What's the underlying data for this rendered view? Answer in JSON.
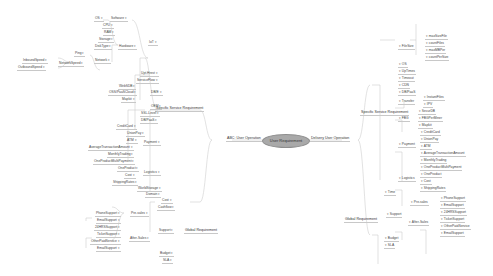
{
  "root": {
    "label": "User Requirement"
  },
  "left": {
    "label": "ABC: User Operation",
    "branches": [
      {
        "label": "Specific Service Requirement",
        "children": [
          {
            "label": "IoT",
            "children": [
              {
                "label": "Software",
                "children": [
                  {
                    "label": "OS"
                  }
                ]
              },
              {
                "label": "Hardware",
                "children": [
                  {
                    "label": "CPU"
                  },
                  {
                    "label": "RAM"
                  },
                  {
                    "label": "Storage"
                  },
                  {
                    "label": "DiskType"
                  }
                ]
              },
              {
                "label": "Network",
                "children": [
                  {
                    "label": "Ping"
                  },
                  {
                    "label": "NetworkSpeed",
                    "children": [
                      {
                        "label": "InboundSpeed"
                      },
                      {
                        "label": "OutboundSpeed"
                      }
                    ]
                  }
                ]
              }
            ]
          },
          {
            "label": "Upt.Hrest"
          },
          {
            "label": "ServiceFlow"
          },
          {
            "label": "DB/E",
            "children": [
              {
                "label": "WebSDB"
              },
              {
                "label": "OSS/PaaSCloud"
              },
              {
                "label": "Mapkit"
              }
            ]
          },
          {
            "label": "OEM"
          },
          {
            "label": "SSL-Level"
          },
          {
            "label": "DB/PaaS"
          },
          {
            "label": "Payment",
            "children": [
              {
                "label": "CreditCard"
              },
              {
                "label": "UnionPay"
              },
              {
                "label": "ATM"
              },
              {
                "label": "AverageTransactionAmount"
              },
              {
                "label": "MonthlyTrading"
              },
              {
                "label": "OneProductMultiPayment"
              }
            ]
          },
          {
            "label": "Logistics",
            "children": [
              {
                "label": "OneProduct"
              },
              {
                "label": "Cost"
              },
              {
                "label": "ShippingRates"
              }
            ]
          },
          {
            "label": "WorldStorage"
          },
          {
            "label": "Domain"
          }
        ]
      },
      {
        "label": "Global Requirement",
        "children": [
          {
            "label": "Cost"
          },
          {
            "label": "Cashflow"
          },
          {
            "label": "Support",
            "children": [
              {
                "label": "Pre-sales",
                "children": [
                  {
                    "label": "PhoneSupport"
                  },
                  {
                    "label": "EmailSupport"
                  }
                ]
              },
              {
                "label": "After-Sales",
                "children": [
                  {
                    "label": "24HRSSupport"
                  },
                  {
                    "label": "TicketSupport"
                  },
                  {
                    "label": "OtherPaidService"
                  },
                  {
                    "label": "EmailSupport"
                  }
                ]
              }
            ]
          },
          {
            "label": "Budget"
          },
          {
            "label": "SLA"
          }
        ]
      }
    ]
  },
  "right": {
    "label": "Delivery User Operation",
    "branches": [
      {
        "label": "Specific Service Requirement",
        "children": [
          {
            "label": "FileSize",
            "children": [
              {
                "label": "maxSizeFile"
              },
              {
                "label": "countFiles"
              },
              {
                "label": "maxMBPer"
              },
              {
                "label": "countPerSize"
              }
            ]
          },
          {
            "label": "OS"
          },
          {
            "label": "UpTimes"
          },
          {
            "label": "Timeout"
          },
          {
            "label": "CDN"
          },
          {
            "label": "DB/PaaS"
          },
          {
            "label": "Transfer",
            "children": [
              {
                "label": "InstantFiles"
              },
              {
                "label": "IPV"
              }
            ]
          },
          {
            "label": "FBG",
            "children": [
              {
                "label": "SecurDB"
              },
              {
                "label": "FBGPerMiner"
              },
              {
                "label": "Mapkit"
              }
            ]
          },
          {
            "label": "Payment",
            "children": [
              {
                "label": "CreditCard"
              },
              {
                "label": "UnionPay"
              },
              {
                "label": "ATM"
              },
              {
                "label": "AverageTransactionAmount"
              },
              {
                "label": "MonthlyTrading"
              },
              {
                "label": "OneProductMultiPayment"
              }
            ]
          },
          {
            "label": "Logistics",
            "children": [
              {
                "label": "OneProduct"
              },
              {
                "label": "Cost"
              },
              {
                "label": "ShippingRates"
              }
            ]
          }
        ]
      },
      {
        "label": "Global Requirement",
        "children": [
          {
            "label": "Time"
          },
          {
            "label": "Support",
            "children": [
              {
                "label": "Pre-sales",
                "children": [
                  {
                    "label": "PhoneSupport"
                  },
                  {
                    "label": "EmailSupport"
                  }
                ]
              },
              {
                "label": "After-Sales",
                "children": [
                  {
                    "label": "24HRSSupport"
                  },
                  {
                    "label": "TicketSupport"
                  },
                  {
                    "label": "OtherPaidService"
                  },
                  {
                    "label": "EmailSupport"
                  }
                ]
              }
            ]
          },
          {
            "label": "Budget"
          },
          {
            "label": "SLA"
          }
        ]
      }
    ]
  },
  "colors": {
    "line": "#c8c8c8",
    "root_fill": "#a9a9a9",
    "text": "#444444"
  }
}
